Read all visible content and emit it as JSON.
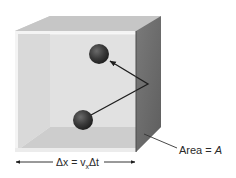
{
  "figure": {
    "title": "",
    "colors": {
      "back_wall": "#d9d9d9",
      "left_wall": "#cfcfcf",
      "top_face": "#c8c8c8",
      "floor": "#bdbdbd",
      "front_glass": "#e4e4e4",
      "front_rim": "#f2f2f2",
      "right_face": "#6e6e6e",
      "right_face_edge": "#4a4a4a",
      "molecule": "#3a3a3a",
      "arrow": "#1e1e1e",
      "text": "#2a2a2a"
    },
    "box": {
      "front": {
        "x1": 15,
        "y1": 31,
        "x2": 136,
        "y2": 152
      },
      "back": {
        "x1": 50,
        "y1": 16,
        "x2": 161,
        "y2": 127
      }
    },
    "molecules": [
      {
        "id": "molecule-before-collision",
        "cx": 83,
        "cy": 120,
        "r": 10
      },
      {
        "id": "molecule-after-collision",
        "cx": 99,
        "cy": 54,
        "r": 10
      }
    ],
    "trajectory": {
      "start": [
        91,
        115
      ],
      "bounce": [
        148,
        84
      ],
      "end": [
        110,
        61
      ]
    },
    "labels": {
      "distance": {
        "prefix": "Δx = v",
        "subscript": "x",
        "suffix": "Δt",
        "x": 56,
        "y": 167
      },
      "area": {
        "text": "Area = ",
        "symbol": "A",
        "x": 179,
        "y": 154
      }
    },
    "dimension_arrow": {
      "y": 162,
      "x_start": 15,
      "x_end": 136,
      "gap_start": 53,
      "gap_end": 104
    },
    "area_leader": {
      "from": [
        144,
        134
      ],
      "to": [
        177,
        148
      ]
    }
  }
}
